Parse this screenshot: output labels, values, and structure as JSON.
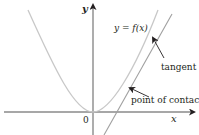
{
  "diagram": {
    "type": "function-tangent",
    "axes": {
      "x_label": "x",
      "y_label": "y",
      "origin_label": "0"
    },
    "curve": {
      "label": "y = f(x)",
      "color": "#c8c8c8"
    },
    "tangent": {
      "label": "tangent",
      "color": "#a0a0a0"
    },
    "contact": {
      "label": "point of contact"
    },
    "colors": {
      "axis": "#8a8a8a",
      "arrow": "#231f20",
      "text": "#231f20"
    }
  }
}
